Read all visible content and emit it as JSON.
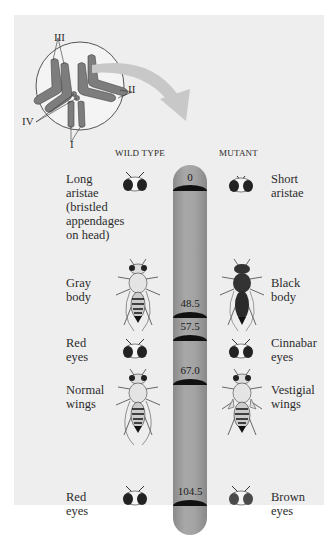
{
  "inset": {
    "chromosome_labels": [
      "III",
      "II",
      "IV",
      "I"
    ]
  },
  "columns": {
    "wild_type": "Wild type",
    "mutant": "Mutant"
  },
  "loci": [
    {
      "position": "0",
      "wild_type": "Long aristae (bristled appendages on head)",
      "mutant": "Short aristae",
      "wild_icon": "fly-head-icon",
      "mutant_icon": "fly-head-icon"
    },
    {
      "position": "48.5",
      "wild_type": "Gray body",
      "mutant": "Black body",
      "wild_icon": "fly-body-icon",
      "mutant_icon": "fly-body-dark-icon"
    },
    {
      "position": "57.5",
      "wild_type": "Red eyes",
      "mutant": "Cinnabar eyes",
      "wild_icon": "fly-head-icon",
      "mutant_icon": "fly-head-icon"
    },
    {
      "position": "67.0",
      "wild_type": "Normal wings",
      "mutant": "Vestigial wings",
      "wild_icon": "fly-body-icon",
      "mutant_icon": "fly-vestigial-icon"
    },
    {
      "position": "104.5",
      "wild_type": "Red eyes",
      "mutant": "Brown eyes",
      "wild_icon": "fly-head-icon",
      "mutant_icon": "fly-head-icon"
    }
  ],
  "text": {
    "l0a": "Long",
    "l0b": "aristae",
    "l0c": "(bristled",
    "l0d": "appendages",
    "l0e": "on head)",
    "r0a": "Short",
    "r0b": "aristae",
    "l1a": "Gray",
    "l1b": "body",
    "r1a": "Black",
    "r1b": "body",
    "l2a": "Red",
    "l2b": "eyes",
    "r2a": "Cinnabar",
    "r2b": "eyes",
    "l3a": "Normal",
    "l3b": "wings",
    "r3a": "Vestigial",
    "r3b": "wings",
    "l4a": "Red",
    "l4b": "eyes",
    "r4a": "Brown",
    "r4b": "eyes"
  },
  "colors": {
    "panel": "#eeeeee",
    "chromosome": "#9a9a9a",
    "band": "#111111",
    "arrow": "#c8c8c8"
  }
}
